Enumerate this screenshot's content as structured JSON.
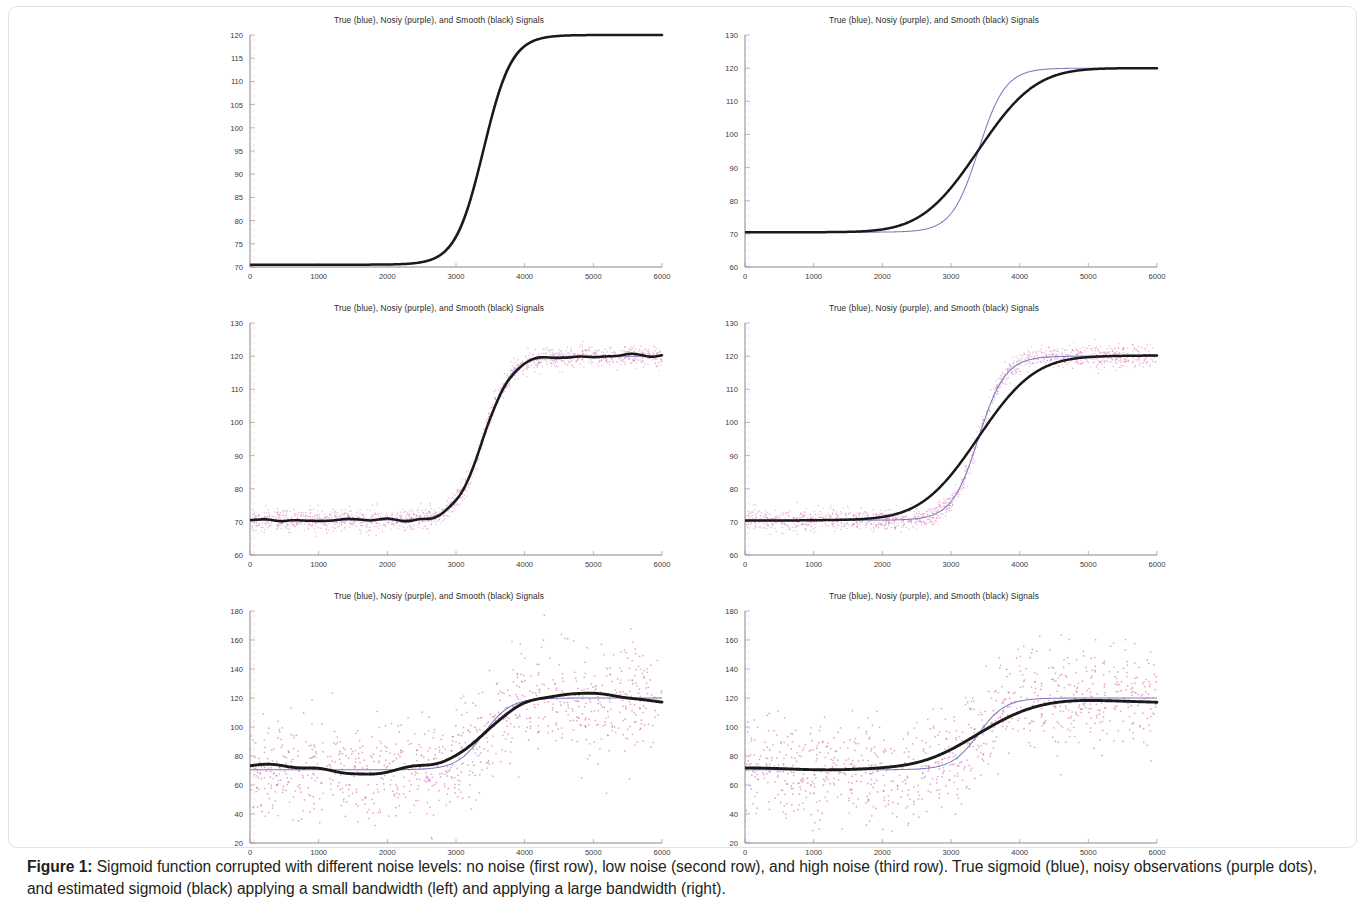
{
  "figure": {
    "caption_label": "Figure 1:",
    "caption_text": " Sigmoid function corrupted with different noise levels: no noise (first row), low noise (second row), and high noise (third row). True sigmoid (blue), noisy observations (purple dots), and estimated sigmoid (black) applying a small bandwidth (left) and applying a large bandwidth (right).",
    "colors": {
      "true_signal_blue": "#7b7bc0",
      "noisy_points_purple": "#d46aa8",
      "smooth_signal_black": "#1a1a1a",
      "axis": "#7a7a7a",
      "text": "#2b2b2b",
      "frame_border": "#e2e2e2"
    }
  },
  "panels": [
    {
      "id": "row1-left",
      "title": "True (blue), Nosiy (purple), and Smooth (black) Signals",
      "row_label": "no noise",
      "bandwidth": "small",
      "noise_sigma": 0,
      "xticks": [
        0,
        1000,
        2000,
        3000,
        4000,
        5000,
        6000
      ],
      "yticks": [
        70,
        75,
        80,
        85,
        90,
        95,
        100,
        105,
        110,
        115,
        120
      ],
      "xlim": [
        0,
        6000
      ],
      "ylim": [
        70,
        120
      ]
    },
    {
      "id": "row1-right",
      "title": "True (blue), Nosiy (purple), and Smooth (black) Signals",
      "row_label": "no noise",
      "bandwidth": "large",
      "noise_sigma": 0,
      "xticks": [
        0,
        1000,
        2000,
        3000,
        4000,
        5000,
        6000
      ],
      "yticks": [
        60,
        70,
        80,
        90,
        100,
        110,
        120,
        130
      ],
      "xlim": [
        0,
        6000
      ],
      "ylim": [
        60,
        130
      ]
    },
    {
      "id": "row2-left",
      "title": "True (blue), Nosiy (purple), and Smooth (black) Signals",
      "row_label": "low noise",
      "bandwidth": "small",
      "noise_sigma": 1.6,
      "xticks": [
        0,
        1000,
        2000,
        3000,
        4000,
        5000,
        6000
      ],
      "yticks": [
        60,
        70,
        80,
        90,
        100,
        110,
        120,
        130
      ],
      "xlim": [
        0,
        6000
      ],
      "ylim": [
        60,
        130
      ]
    },
    {
      "id": "row2-right",
      "title": "True (blue), Nosiy (purple), and Smooth (black) Signals",
      "row_label": "low noise",
      "bandwidth": "large",
      "noise_sigma": 1.6,
      "xticks": [
        0,
        1000,
        2000,
        3000,
        4000,
        5000,
        6000
      ],
      "yticks": [
        60,
        70,
        80,
        90,
        100,
        110,
        120,
        130
      ],
      "xlim": [
        0,
        6000
      ],
      "ylim": [
        60,
        130
      ]
    },
    {
      "id": "row3-left",
      "title": "True (blue), Nosiy (purple), and Smooth (black) Signals",
      "row_label": "high noise",
      "bandwidth": "small",
      "noise_sigma": 18,
      "xticks": [
        0,
        1000,
        2000,
        3000,
        4000,
        5000,
        6000
      ],
      "yticks": [
        20,
        40,
        60,
        80,
        100,
        120,
        140,
        160,
        180
      ],
      "xlim": [
        0,
        6000
      ],
      "ylim": [
        20,
        180
      ]
    },
    {
      "id": "row3-right",
      "title": "True (blue), Nosiy (purple), and Smooth (black) Signals",
      "row_label": "high noise",
      "bandwidth": "large",
      "noise_sigma": 18,
      "xticks": [
        0,
        1000,
        2000,
        3000,
        4000,
        5000,
        6000
      ],
      "yticks": [
        20,
        40,
        60,
        80,
        100,
        120,
        140,
        160,
        180
      ],
      "xlim": [
        0,
        6000
      ],
      "ylim": [
        20,
        180
      ]
    }
  ],
  "chart_data": {
    "type": "line",
    "title": "True (blue), Nosiy (purple), and Smooth (black) Signals",
    "xlabel": "",
    "ylabel": "",
    "grid": false,
    "legend_position": "in-title",
    "legend": [
      {
        "name": "True signal",
        "color": "#7b7bc0",
        "style": "thin line"
      },
      {
        "name": "Noisy observations",
        "color": "#d46aa8",
        "style": "dots"
      },
      {
        "name": "Smooth estimate",
        "color": "#1a1a1a",
        "style": "thick line"
      }
    ],
    "true_sigmoid": {
      "formula": "L0 + A / (1 + exp(-(x - x0)/k))",
      "L0": 70.5,
      "A": 49.5,
      "x0": 3400,
      "k": 195
    },
    "x": [
      0,
      500,
      1000,
      1500,
      2000,
      2500,
      3000,
      3500,
      4000,
      4500,
      5000,
      5500,
      6000
    ],
    "series": [
      {
        "name": "True sigmoid (blue)",
        "color": "#7b7bc0",
        "values": [
          70.5,
          70.5,
          70.5,
          70.5,
          70.5,
          70.8,
          76.1,
          95.2,
          114.6,
          119.9,
          120.0,
          120.0,
          120.0
        ]
      },
      {
        "name": "Smooth estimate, small bandwidth (black, left column)",
        "color": "#1a1a1a",
        "values": [
          70.4,
          70.4,
          70.5,
          70.4,
          70.5,
          70.9,
          76.3,
          95.3,
          114.5,
          119.9,
          120.2,
          120.3,
          120.6
        ]
      },
      {
        "name": "Smooth estimate, large bandwidth (black, right column)",
        "color": "#1a1a1a",
        "values": [
          69.8,
          70.8,
          70.7,
          69.6,
          69.4,
          72.6,
          81.3,
          95.4,
          109.7,
          119.1,
          122.3,
          121.1,
          119.9
        ]
      }
    ],
    "axes": {
      "row1_left": {
        "xlim": [
          0,
          6000
        ],
        "ylim": [
          70,
          120
        ],
        "ytick_step": 5
      },
      "row1_right": {
        "xlim": [
          0,
          6000
        ],
        "ylim": [
          60,
          130
        ],
        "ytick_step": 10
      },
      "row2": {
        "xlim": [
          0,
          6000
        ],
        "ylim": [
          60,
          130
        ],
        "ytick_step": 10
      },
      "row3": {
        "xlim": [
          0,
          6000
        ],
        "ylim": [
          20,
          180
        ],
        "ytick_step": 20
      }
    },
    "noise_levels": [
      {
        "row": 1,
        "label": "no noise",
        "sigma": 0
      },
      {
        "row": 2,
        "label": "low noise",
        "sigma": 1.6
      },
      {
        "row": 3,
        "label": "high noise",
        "sigma": 18
      }
    ]
  }
}
